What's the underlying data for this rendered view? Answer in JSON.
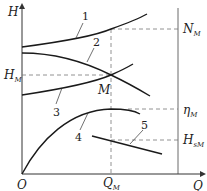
{
  "diagram": {
    "type": "pump characteristic curves",
    "axes": {
      "y_label": "H",
      "x_label": "Q",
      "origin_label": "O"
    },
    "point": {
      "label": "M",
      "x_label": "Q",
      "x_label_sub": "M",
      "y_label": "H",
      "y_label_sub": "M"
    },
    "right_labels": [
      {
        "main": "N",
        "sub": "M"
      },
      {
        "main": "η",
        "sub": "M"
      },
      {
        "main": "H",
        "sub": "sM"
      }
    ],
    "curves": [
      {
        "id": "1",
        "label": "1",
        "description": "power curve N-Q"
      },
      {
        "id": "2",
        "label": "2",
        "description": "pump head curve H-Q"
      },
      {
        "id": "3",
        "label": "3",
        "description": "system curve"
      },
      {
        "id": "4",
        "label": "4",
        "description": "efficiency curve η-Q"
      },
      {
        "id": "5",
        "label": "5",
        "description": "suction head curve Hs-Q"
      }
    ],
    "colors": {
      "curve": "#1a1a1a",
      "axis": "#333333",
      "dashed": "#666666"
    }
  }
}
